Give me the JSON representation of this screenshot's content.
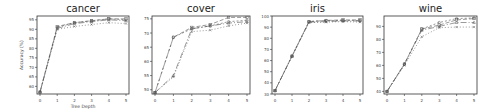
{
  "figure": {
    "xlabel": "Tree Depth",
    "ylabel": "Accuracy (%)"
  },
  "chart_data": [
    {
      "type": "line",
      "title": "cancer",
      "xlabel": "Tree Depth",
      "ylabel": "Accuracy (%)",
      "x": [
        0,
        1,
        2,
        3,
        4,
        5
      ],
      "xlim": [
        0,
        5
      ],
      "ylim": [
        56,
        97
      ],
      "yticks": [
        60,
        65,
        70,
        75,
        80,
        85,
        90,
        95
      ],
      "grid": false,
      "series": [
        {
          "name": "series-1",
          "values": [
            57,
            91.5,
            93.5,
            94.5,
            95.5,
            95.5
          ],
          "dash": "4,2",
          "marker": "square"
        },
        {
          "name": "series-2",
          "values": [
            57,
            91,
            93.5,
            94.5,
            95.5,
            95
          ],
          "dash": "2,2",
          "marker": "circle"
        },
        {
          "name": "series-3",
          "values": [
            57,
            90.5,
            93,
            94,
            95,
            94.5
          ],
          "dash": "6,2,1,2",
          "marker": "triangle"
        },
        {
          "name": "series-4",
          "values": [
            57,
            90,
            91.5,
            92.5,
            93.5,
            93
          ],
          "dash": "1,2",
          "marker": "x"
        }
      ]
    },
    {
      "type": "line",
      "title": "cover",
      "xlabel": "",
      "ylabel": "",
      "x": [
        0,
        1,
        2,
        3,
        4,
        5
      ],
      "xlim": [
        0,
        5
      ],
      "ylim": [
        48.5,
        76
      ],
      "yticks": [
        50,
        55,
        60,
        65,
        70,
        75
      ],
      "grid": false,
      "series": [
        {
          "name": "series-1",
          "values": [
            49,
            68.5,
            72,
            73,
            75.5,
            75.5
          ],
          "dash": "4,2",
          "marker": "square"
        },
        {
          "name": "series-2",
          "values": [
            49,
            68.5,
            71.5,
            72.5,
            74,
            74.5
          ],
          "dash": "2,2",
          "marker": "circle"
        },
        {
          "name": "series-3",
          "values": [
            49,
            55,
            71.5,
            72.5,
            73.5,
            74
          ],
          "dash": "6,2,1,2",
          "marker": "triangle"
        },
        {
          "name": "series-4",
          "values": [
            49,
            54.5,
            70.5,
            71,
            72.5,
            73.5
          ],
          "dash": "1,2",
          "marker": "x"
        }
      ]
    },
    {
      "type": "line",
      "title": "iris",
      "xlabel": "",
      "ylabel": "",
      "x": [
        0,
        1,
        2,
        3,
        4,
        5
      ],
      "xlim": [
        0,
        5
      ],
      "ylim": [
        30,
        100
      ],
      "yticks": [
        30,
        40,
        50,
        60,
        70,
        80,
        90,
        100
      ],
      "grid": false,
      "series": [
        {
          "name": "series-1",
          "values": [
            33,
            64,
            95,
            96,
            96.5,
            96.5
          ],
          "dash": "4,2",
          "marker": "square"
        },
        {
          "name": "series-2",
          "values": [
            33,
            64,
            95,
            96,
            96,
            96
          ],
          "dash": "2,2",
          "marker": "circle"
        },
        {
          "name": "series-3",
          "values": [
            33,
            64,
            94.5,
            95,
            95.5,
            95.5
          ],
          "dash": "6,2,1,2",
          "marker": "triangle"
        },
        {
          "name": "series-4",
          "values": [
            33,
            64,
            94,
            94.5,
            95,
            94.5
          ],
          "dash": "1,2",
          "marker": "x"
        }
      ]
    },
    {
      "type": "line",
      "title": "wine",
      "xlabel": "",
      "ylabel": "",
      "x": [
        0,
        1,
        2,
        3,
        4,
        5
      ],
      "xlim": [
        0,
        5
      ],
      "ylim": [
        38,
        98
      ],
      "yticks": [
        40,
        50,
        60,
        70,
        80,
        90
      ],
      "grid": false,
      "series": [
        {
          "name": "series-1",
          "values": [
            40,
            61,
            88,
            91,
            95,
            96
          ],
          "dash": "4,2",
          "marker": "square"
        },
        {
          "name": "series-2",
          "values": [
            40,
            61,
            88,
            93,
            96,
            96.5
          ],
          "dash": "2,2",
          "marker": "circle"
        },
        {
          "name": "series-3",
          "values": [
            40,
            61,
            87,
            90,
            93,
            93
          ],
          "dash": "6,2,1,2",
          "marker": "triangle"
        },
        {
          "name": "series-4",
          "values": [
            40,
            60,
            82,
            89,
            89.5,
            89.5
          ],
          "dash": "1,2",
          "marker": "x"
        }
      ]
    }
  ],
  "layout": {
    "panels": [
      {
        "box": [
          37,
          16,
          92,
          78
        ]
      },
      {
        "box": [
          152,
          16,
          98,
          78
        ]
      },
      {
        "box": [
          272,
          16,
          91,
          78
        ]
      },
      {
        "box": [
          384,
          16,
          93,
          78
        ]
      }
    ],
    "line_color": "#555555",
    "axis_color": "#333333",
    "tick_label_color": "#444444",
    "title_color": "#222222"
  }
}
